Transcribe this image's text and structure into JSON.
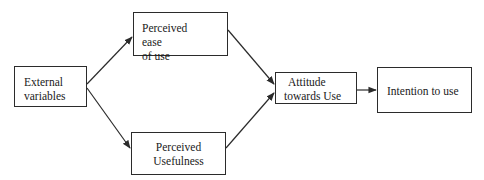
{
  "diagram": {
    "type": "flowchart",
    "title": "",
    "nodes": [
      {
        "id": "ext",
        "lines": [
          "External",
          "variables"
        ]
      },
      {
        "id": "peou",
        "lines": [
          "Perceived ease",
          "of use"
        ]
      },
      {
        "id": "pu",
        "lines": [
          "Perceived",
          "Usefulness"
        ]
      },
      {
        "id": "att",
        "lines": [
          "Attitude",
          "towards Use"
        ]
      },
      {
        "id": "int",
        "lines": [
          "Intention to use"
        ]
      }
    ],
    "edges": [
      {
        "from": "ext",
        "to": "peou"
      },
      {
        "from": "ext",
        "to": "pu"
      },
      {
        "from": "peou",
        "to": "att"
      },
      {
        "from": "pu",
        "to": "att"
      },
      {
        "from": "att",
        "to": "int"
      }
    ],
    "colors": {
      "stroke": "#2b2b2b",
      "background": "#ffffff"
    }
  }
}
